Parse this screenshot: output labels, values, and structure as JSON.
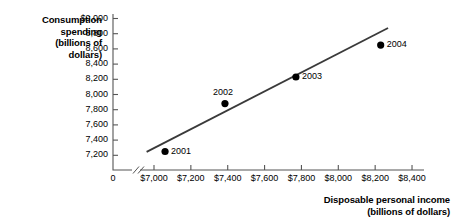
{
  "chart_data": {
    "type": "scatter",
    "title": "",
    "xlabel": "Disposable personal income (billions of dollars)",
    "ylabel": "Consumption spending (billions of dollars)",
    "xlabel_line1": "Disposable personal income",
    "xlabel_line2": "(billions of dollars)",
    "ylabel_line1": "Consumption",
    "ylabel_line2": "spending",
    "ylabel_line3": "(billions of",
    "ylabel_line4": "dollars)",
    "origin_label": "0",
    "grid": false,
    "legend": "none",
    "xlim": [
      7000,
      8400
    ],
    "ylim": [
      7200,
      9000
    ],
    "x_ticks": [
      "$7,000",
      "$7,200",
      "$7,400",
      "$7,600",
      "$7,800",
      "$8,000",
      "$8,200",
      "$8,400"
    ],
    "x_tick_values": [
      7000,
      7200,
      7400,
      7600,
      7800,
      8000,
      8200,
      8400
    ],
    "y_ticks": [
      "$9,000",
      "8,800",
      "8,600",
      "8,400",
      "8,200",
      "8,000",
      "7,800",
      "7,600",
      "7,400",
      "7,200"
    ],
    "y_tick_values": [
      9000,
      8800,
      8600,
      8400,
      8200,
      8000,
      7800,
      7600,
      7400,
      7200
    ],
    "points": [
      {
        "label": "2001",
        "x": 7060,
        "y": 7250,
        "label_side": "right"
      },
      {
        "label": "2002",
        "x": 7385,
        "y": 7880,
        "label_side": "above"
      },
      {
        "label": "2003",
        "x": 7770,
        "y": 8230,
        "label_side": "right"
      },
      {
        "label": "2004",
        "x": 8230,
        "y": 8650,
        "label_side": "right"
      }
    ],
    "trend_line": {
      "x0": 6960,
      "y0": 7245,
      "x1": 8270,
      "y1": 8875
    },
    "colors": {
      "point": "#000000",
      "line": "#3a3a3a",
      "axis": "#555555",
      "text": "#000000",
      "background": "#ffffff"
    },
    "axis_break": true
  }
}
